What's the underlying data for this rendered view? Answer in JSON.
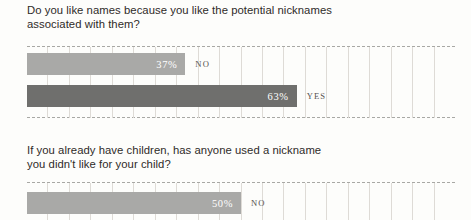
{
  "page": {
    "background_color": "#fdfdfb",
    "text_color": "#2f2b29"
  },
  "colors": {
    "bar_light": "#a9a9a7",
    "bar_dark": "#6f6f6d",
    "gridline": "#dedbd6",
    "dashed_rule": "#9a9a96",
    "value_label": "#ffffff",
    "category_label": "#55524f"
  },
  "sections": [
    {
      "question_line_1": "Do you like names because you like the potential nicknames",
      "question_line_2": "associated with them?",
      "bars": [
        {
          "category": "NO",
          "value_label": "37%",
          "value": 37
        },
        {
          "category": "YES",
          "value_label": "63%",
          "value": 63
        }
      ]
    },
    {
      "question_line_1": "If you already have children, has anyone used a nickname",
      "question_line_2": "you didn't like for your child?",
      "bars": [
        {
          "category": "NO",
          "value_label": "50%",
          "value": 50
        }
      ]
    }
  ],
  "chart_data": [
    {
      "type": "bar",
      "orientation": "horizontal",
      "title": "Do you like names because you like the potential nicknames associated with them?",
      "categories": [
        "NO",
        "YES"
      ],
      "values": [
        37,
        63
      ],
      "data_labels": [
        "37%",
        "63%"
      ],
      "xlabel": "",
      "ylabel": "",
      "xlim": [
        0,
        100
      ],
      "grid": true,
      "gridline_count": 20,
      "legend": "none",
      "series": [
        {
          "name": "Percent of respondents",
          "values": [
            37,
            63
          ]
        }
      ]
    },
    {
      "type": "bar",
      "orientation": "horizontal",
      "title": "If you already have children, has anyone used a nickname you didn't like for your child?",
      "categories": [
        "NO"
      ],
      "values": [
        50
      ],
      "data_labels": [
        "50%"
      ],
      "xlabel": "",
      "ylabel": "",
      "xlim": [
        0,
        100
      ],
      "grid": true,
      "gridline_count": 20,
      "legend": "none",
      "note": "chart is cropped at the bottom edge of the screenshot",
      "series": [
        {
          "name": "Percent of respondents",
          "values": [
            50
          ]
        }
      ]
    }
  ]
}
